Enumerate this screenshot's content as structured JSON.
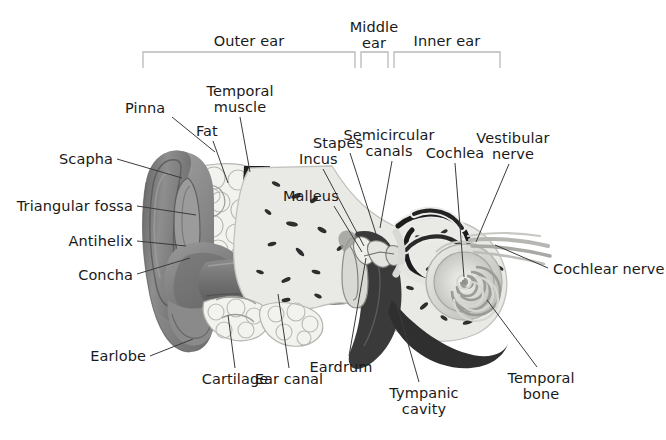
{
  "figure": {
    "background": "#ffffff",
    "text_color": "#1a1a1a",
    "leader_color": "#3b3b3b",
    "bracket_color": "#b9b9b9"
  },
  "palette": {
    "pinna_rim_dark": "#6f6f6f",
    "pinna_mid": "#8d8d8d",
    "pinna_light": "#b4b4b4",
    "pinna_shadow": "#5d5d5d",
    "canal_grey": "#7d7d7d",
    "canal_dark": "#5a5a5a",
    "bone_fill": "#e9e9e6",
    "bone_edge": "#c9c9c4",
    "bone_speck": "#2e2e2e",
    "fat_fill": "#f2f2ef",
    "fat_edge": "#b9b9b4",
    "muscle_dark": "#262626",
    "cavity_dark": "#3a3a3a",
    "cochlea_light": "#dcdcd8",
    "cochlea_band": "#9f9f9b",
    "nerve_grey": "#aeaeae",
    "eardrum": "#d6d6d2"
  },
  "brackets": [
    {
      "id": "outer-ear",
      "label": "Outer ear",
      "label_lines": [
        "Outer ear"
      ],
      "x1": 143,
      "x2": 355,
      "y": 52,
      "label_x": 249,
      "label_y": 34
    },
    {
      "id": "middle-ear",
      "label": "Middle ear",
      "label_lines": [
        "Middle",
        "ear"
      ],
      "x1": 361,
      "x2": 388,
      "y": 52,
      "label_x": 374,
      "label_y": 20
    },
    {
      "id": "inner-ear",
      "label": "Inner ear",
      "label_lines": [
        "Inner ear"
      ],
      "x1": 394,
      "x2": 500,
      "y": 52,
      "label_x": 447,
      "label_y": 34
    }
  ],
  "labels": [
    {
      "id": "pinna",
      "lines": [
        "Pinna"
      ],
      "x": 125,
      "y": 101,
      "align": "left",
      "leader": [
        [
          172,
          117
        ],
        [
          215,
          152
        ]
      ]
    },
    {
      "id": "temporal-muscle",
      "lines": [
        "Temporal",
        "muscle"
      ],
      "x": 240,
      "y": 84,
      "align": "center",
      "leader": [
        [
          240,
          117
        ],
        [
          250,
          172
        ]
      ]
    },
    {
      "id": "fat",
      "lines": [
        "Fat"
      ],
      "x": 196,
      "y": 124,
      "align": "left",
      "leader": [
        [
          213,
          141
        ],
        [
          228,
          183
        ]
      ]
    },
    {
      "id": "scapha",
      "lines": [
        "Scapha"
      ],
      "x": 113,
      "y": 152,
      "align": "right",
      "leader": [
        [
          117,
          159
        ],
        [
          182,
          178
        ]
      ]
    },
    {
      "id": "triangular-fossa",
      "lines": [
        "Triangular fossa"
      ],
      "x": 133,
      "y": 199,
      "align": "right",
      "leader": [
        [
          137,
          206
        ],
        [
          196,
          215
        ]
      ]
    },
    {
      "id": "antihelix",
      "lines": [
        "Antihelix"
      ],
      "x": 133,
      "y": 234,
      "align": "right",
      "leader": [
        [
          137,
          241
        ],
        [
          186,
          246
        ]
      ]
    },
    {
      "id": "concha",
      "lines": [
        "Concha"
      ],
      "x": 133,
      "y": 268,
      "align": "right",
      "leader": [
        [
          137,
          274
        ],
        [
          190,
          258
        ]
      ]
    },
    {
      "id": "earlobe",
      "lines": [
        "Earlobe"
      ],
      "x": 146,
      "y": 349,
      "align": "right",
      "leader": [
        [
          150,
          356
        ],
        [
          193,
          339
        ]
      ]
    },
    {
      "id": "cartilage",
      "lines": [
        "Cartilage"
      ],
      "x": 235,
      "y": 372,
      "align": "center",
      "leader": [
        [
          235,
          368
        ],
        [
          228,
          315
        ]
      ]
    },
    {
      "id": "ear-canal",
      "lines": [
        "Ear canal"
      ],
      "x": 289,
      "y": 372,
      "align": "center",
      "leader": [
        [
          289,
          368
        ],
        [
          278,
          294
        ]
      ]
    },
    {
      "id": "incus",
      "lines": [
        "Incus"
      ],
      "x": 299,
      "y": 152,
      "align": "left",
      "leader": [
        [
          323,
          169
        ],
        [
          364,
          246
        ]
      ]
    },
    {
      "id": "stapes",
      "lines": [
        "Stapes"
      ],
      "x": 313,
      "y": 136,
      "align": "left",
      "leader": [
        [
          350,
          153
        ],
        [
          378,
          240
        ]
      ]
    },
    {
      "id": "malleus",
      "lines": [
        "Malleus"
      ],
      "x": 283,
      "y": 189,
      "align": "left",
      "leader": [
        [
          334,
          206
        ],
        [
          362,
          252
        ]
      ]
    },
    {
      "id": "semicircular-canals",
      "lines": [
        "Semicircular",
        "canals"
      ],
      "x": 389,
      "y": 128,
      "align": "center",
      "leader": [
        [
          392,
          161
        ],
        [
          380,
          228
        ]
      ]
    },
    {
      "id": "cochlea",
      "lines": [
        "Cochlea"
      ],
      "x": 455,
      "y": 146,
      "align": "center",
      "leader": [
        [
          455,
          163
        ],
        [
          464,
          277
        ]
      ]
    },
    {
      "id": "vestibular-nerve",
      "lines": [
        "Vestibular",
        "nerve"
      ],
      "x": 513,
      "y": 131,
      "align": "center",
      "leader": [
        [
          509,
          164
        ],
        [
          476,
          242
        ]
      ]
    },
    {
      "id": "cochlear-nerve",
      "lines": [
        "Cochlear nerve"
      ],
      "x": 553,
      "y": 262,
      "align": "left",
      "leader": [
        [
          548,
          268
        ],
        [
          495,
          245
        ]
      ]
    },
    {
      "id": "eardrum",
      "lines": [
        "Eardrum"
      ],
      "x": 341,
      "y": 360,
      "align": "center",
      "leader": [
        [
          349,
          356
        ],
        [
          366,
          258
        ]
      ]
    },
    {
      "id": "tympanic-cavity",
      "lines": [
        "Tympanic",
        "cavity"
      ],
      "x": 424,
      "y": 386,
      "align": "center",
      "leader": [
        [
          419,
          382
        ],
        [
          389,
          277
        ]
      ]
    },
    {
      "id": "temporal-bone",
      "lines": [
        "Temporal",
        "bone"
      ],
      "x": 541,
      "y": 371,
      "align": "center",
      "leader": [
        [
          537,
          367
        ],
        [
          487,
          300
        ]
      ]
    }
  ]
}
